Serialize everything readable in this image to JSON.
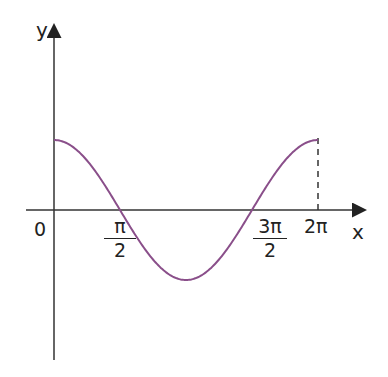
{
  "chart_data": {
    "type": "line",
    "title": "",
    "function": "cos(x)",
    "xlabel": "x",
    "ylabel": "y",
    "origin_label": "0",
    "x_ticks": [
      {
        "value": 1.5708,
        "num": "π",
        "den": "2"
      },
      {
        "value": 4.7124,
        "num": "3π",
        "den": "2"
      },
      {
        "value": 6.2832,
        "label": "2π"
      }
    ],
    "xlim": [
      0,
      6.2832
    ],
    "ylim": [
      -1,
      1
    ],
    "x": [
      0,
      0.7854,
      1.5708,
      2.3562,
      3.1416,
      3.927,
      4.7124,
      5.4978,
      6.2832
    ],
    "series": [
      {
        "name": "y = cos x",
        "values": [
          1,
          0.707,
          0,
          -0.707,
          -1,
          -0.707,
          0,
          0.707,
          1
        ],
        "color": "#8a4f8a"
      }
    ],
    "annotations": [
      "dashed vertical line at x = 2π from curve to x-axis"
    ],
    "grid": false,
    "legend": "none"
  }
}
